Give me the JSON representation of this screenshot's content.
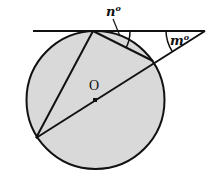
{
  "diagram": {
    "type": "circle-tangent-secant-geometry",
    "circle": {
      "center_label": "O",
      "fill": "#d9d9d9",
      "stroke": "#111111"
    },
    "labels": {
      "angle_n": "n",
      "angle_m": "m",
      "degree_symbol": "o",
      "center": "O"
    },
    "elements": [
      "tangent line touching circle at top vertex",
      "chord from top vertex to right intersection point",
      "chord from top vertex to lower-left point",
      "secant from lower-left point through center O to tangent line",
      "angle n° between tangent and chord at top vertex",
      "angle m° between tangent and secant outside circle"
    ]
  }
}
